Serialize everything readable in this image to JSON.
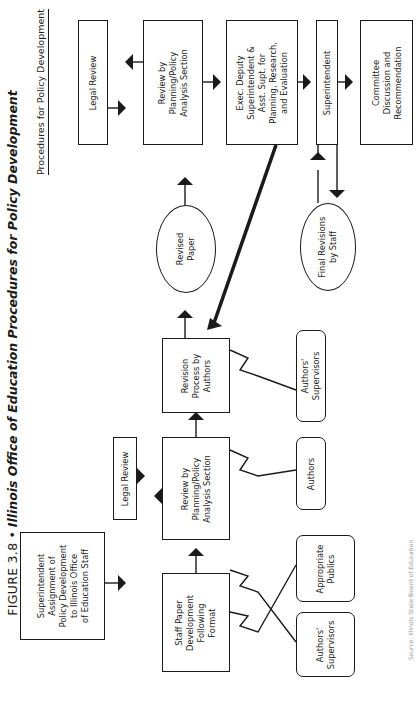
{
  "figure": {
    "label": "FIGURE 3.8",
    "bullet": "•",
    "title": "Illinois Office of Education Procedures for Policy Development"
  },
  "header": {
    "text": "Procedures for Policy Development"
  },
  "nodes": {
    "superintendent_assignment": "Superintendent\nAssignment of\nPolicy Development\nto Illinois Office\nof Education Staff",
    "staff_paper": "Staff Paper\nDevelopment\nFollowing\nFormat",
    "legal_review_1": "Legal Review",
    "review_planning_1": "Review by\nPlanning/Policy\nAnalysis Section",
    "revision_process": "Revision\nProcess by\nAuthors",
    "revised_paper": "Revised\nPaper",
    "legal_review_2": "Legal Review",
    "review_planning_2": "Review by\nPlanning/Policy\nAnalysis Section",
    "exec_deputy": "Exec. Deputy\nSuperintendent &\nAsst. Supt. for\nPlanning, Research,\nand Evaluation",
    "superintendent": "Superintendent",
    "final_revisions": "Final Revisions\nby Staff",
    "committee": "Committee\nDiscussion and\nRecommendation",
    "authors_supervisors_1": "Authors'\nSupervisors",
    "appropriate_publics": "Appropriate\nPublics",
    "authors": "Authors",
    "authors_supervisors_2": "Authors'\nSupervisors"
  },
  "source_note": "Source: Illinois State Board of Education",
  "colors": {
    "ink": "#1a1a1a",
    "paper": "#ffffff",
    "faint": "#9a9a9a"
  }
}
